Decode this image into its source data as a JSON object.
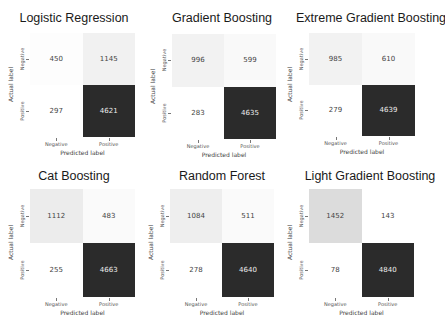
{
  "chart_data": [
    {
      "type": "heatmap",
      "title": "Logistic Regression",
      "xlabel": "Predicted label",
      "ylabel": "Actual label",
      "x_categories": [
        "Negative",
        "Positive"
      ],
      "y_categories": [
        "Negative",
        "Positive"
      ],
      "values": [
        [
          450,
          1145
        ],
        [
          297,
          4621
        ]
      ],
      "cell_colors": [
        [
          "#fdfdfd",
          "#f1f1f1"
        ],
        [
          "#ffffff",
          "#2b2b2b"
        ]
      ],
      "text_colors": [
        [
          "#444444",
          "#444444"
        ],
        [
          "#444444",
          "#eeeeee"
        ]
      ]
    },
    {
      "type": "heatmap",
      "title": "Gradient Boosting",
      "xlabel": "Predicted label",
      "ylabel": "Actual label",
      "x_categories": [
        "Negative",
        "Positive"
      ],
      "y_categories": [
        "Negative",
        "Positive"
      ],
      "values": [
        [
          996,
          599
        ],
        [
          283,
          4635
        ]
      ],
      "cell_colors": [
        [
          "#f2f2f2",
          "#f9f9f9"
        ],
        [
          "#ffffff",
          "#2b2b2b"
        ]
      ],
      "text_colors": [
        [
          "#444444",
          "#444444"
        ],
        [
          "#444444",
          "#eeeeee"
        ]
      ]
    },
    {
      "type": "heatmap",
      "title": "Extreme Gradient Boosting",
      "xlabel": "Predicted label",
      "ylabel": "Actual label",
      "x_categories": [
        "Negative",
        "Positive"
      ],
      "y_categories": [
        "Negative",
        "Positive"
      ],
      "values": [
        [
          985,
          610
        ],
        [
          279,
          4639
        ]
      ],
      "cell_colors": [
        [
          "#f2f2f2",
          "#f9f9f9"
        ],
        [
          "#ffffff",
          "#2b2b2b"
        ]
      ],
      "text_colors": [
        [
          "#444444",
          "#444444"
        ],
        [
          "#444444",
          "#eeeeee"
        ]
      ]
    },
    {
      "type": "heatmap",
      "title": "Cat Boosting",
      "xlabel": "Predicted label",
      "ylabel": "Actual label",
      "x_categories": [
        "Negative",
        "Positive"
      ],
      "y_categories": [
        "Negative",
        "Positive"
      ],
      "values": [
        [
          1112,
          483
        ],
        [
          255,
          4663
        ]
      ],
      "cell_colors": [
        [
          "#ececec",
          "#fafafa"
        ],
        [
          "#ffffff",
          "#2b2b2b"
        ]
      ],
      "text_colors": [
        [
          "#444444",
          "#444444"
        ],
        [
          "#444444",
          "#eeeeee"
        ]
      ]
    },
    {
      "type": "heatmap",
      "title": "Random Forest",
      "xlabel": "Predicted label",
      "ylabel": "Actual label",
      "x_categories": [
        "Negative",
        "Positive"
      ],
      "y_categories": [
        "Negative",
        "Positive"
      ],
      "values": [
        [
          1084,
          511
        ],
        [
          278,
          4640
        ]
      ],
      "cell_colors": [
        [
          "#eeeeee",
          "#fafafa"
        ],
        [
          "#ffffff",
          "#2b2b2b"
        ]
      ],
      "text_colors": [
        [
          "#444444",
          "#444444"
        ],
        [
          "#444444",
          "#eeeeee"
        ]
      ]
    },
    {
      "type": "heatmap",
      "title": "Light Gradient Boosting",
      "xlabel": "Predicted label",
      "ylabel": "Actual label",
      "x_categories": [
        "Negative",
        "Positive"
      ],
      "y_categories": [
        "Negative",
        "Positive"
      ],
      "values": [
        [
          1452,
          143
        ],
        [
          78,
          4840
        ]
      ],
      "cell_colors": [
        [
          "#dcdcdc",
          "#ffffff"
        ],
        [
          "#ffffff",
          "#2b2b2b"
        ]
      ],
      "text_colors": [
        [
          "#444444",
          "#444444"
        ],
        [
          "#444444",
          "#eeeeee"
        ]
      ]
    }
  ],
  "layout": {
    "panels": [
      {
        "left": 0,
        "top": 0,
        "title_top": 11,
        "matrix": {
          "left": 30,
          "top": 33,
          "width": 105,
          "height": 104
        }
      },
      {
        "left": 148,
        "top": 0,
        "title_top": 11,
        "matrix": {
          "left": 24,
          "top": 34,
          "width": 104,
          "height": 105
        }
      },
      {
        "left": 296,
        "top": 0,
        "title_top": 11,
        "matrix": {
          "left": 13,
          "top": 33,
          "width": 106,
          "height": 103
        }
      },
      {
        "left": 0,
        "top": 163,
        "title_top": 6,
        "matrix": {
          "left": 30,
          "top": 26,
          "width": 105,
          "height": 108
        }
      },
      {
        "left": 148,
        "top": 163,
        "title_top": 6,
        "matrix": {
          "left": 22,
          "top": 26,
          "width": 104,
          "height": 108
        }
      },
      {
        "left": 296,
        "top": 163,
        "title_top": 6,
        "matrix": {
          "left": 13,
          "top": 26,
          "width": 105,
          "height": 108
        }
      }
    ]
  }
}
